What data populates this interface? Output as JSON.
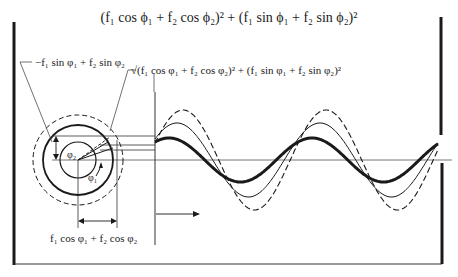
{
  "figure": {
    "title_formula": "(f₁ cos ϕ₁ + f₂ cos ϕ₂)² + (f₁ sin ϕ₁ + f₂ sin ϕ₂)²",
    "labels": {
      "vertical_component": "−f₁ sin φ₁ + f₂ sin φ₂",
      "magnitude": "√(f₁ cos φ₁ + f₂ cos φ₂)² + (f₁ sin φ₁ + f₂ sin φ₂)²",
      "horizontal_component": "f₁ cos φ₁ + f₂ cos φ₂",
      "theta_axis": "—θ—▸",
      "phi2": "φ₂",
      "phi1": "φ₁"
    },
    "phasor_circles": [
      {
        "name": "inner",
        "radius": 18,
        "style": "solid"
      },
      {
        "name": "resultant",
        "radius": 35,
        "style": "thick"
      },
      {
        "name": "outer",
        "radius": 45,
        "style": "dashed"
      }
    ],
    "waves": [
      {
        "name": "component-dashed",
        "style": "dashed",
        "amplitude": 50,
        "phase_px": 0
      },
      {
        "name": "component-thin",
        "style": "solid-thin",
        "amplitude": 37,
        "phase_px": -6
      },
      {
        "name": "resultant-thick",
        "style": "solid-thick",
        "amplitude": 22,
        "phase_px": -14
      }
    ],
    "wave_period_px": 143
  }
}
